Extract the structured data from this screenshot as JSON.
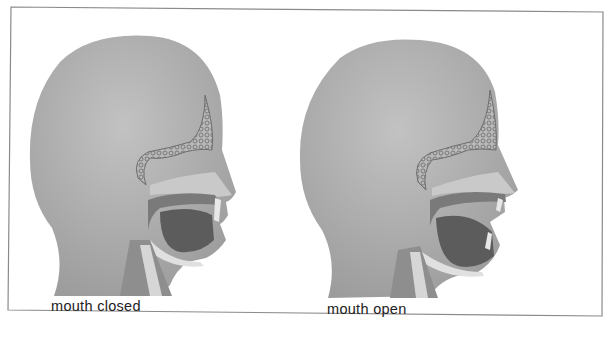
{
  "figure": {
    "panels": [
      {
        "id": "closed",
        "caption": "mouth closed"
      },
      {
        "id": "open",
        "caption": "mouth open"
      }
    ],
    "colors": {
      "skin": "#a9a9a9",
      "sinus_outline": "#6e6e6e",
      "mouth_cavity": "#5c5c5c",
      "airway": "#d6d6d6",
      "border": "#8a8a8a",
      "background": "#ffffff"
    }
  }
}
